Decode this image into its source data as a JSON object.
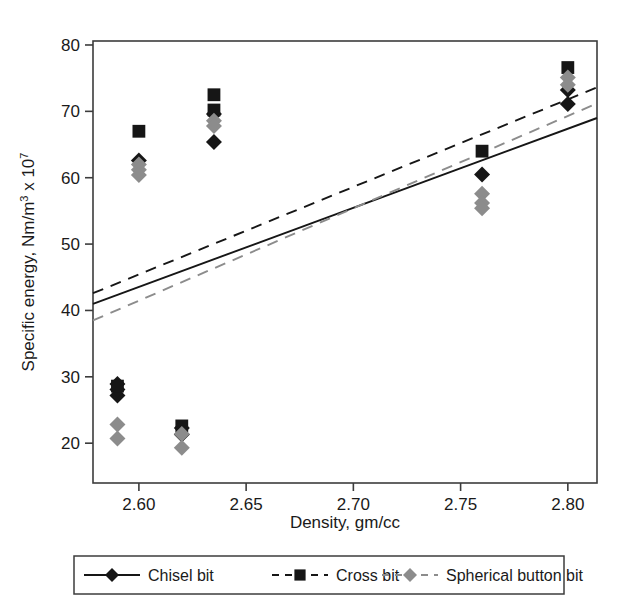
{
  "chart_data": {
    "type": "scatter",
    "title": "",
    "xlabel": "Density, gm/cc",
    "ylabel": "Specific energy, Nm/m3 x 107",
    "ylabel_parts": {
      "main": "Specific energy, Nm/m",
      "sup1": "3",
      "mid": " x 10",
      "sup2": "7"
    },
    "xlim": [
      2.5786,
      2.8136
    ],
    "ylim": [
      14.0,
      80.6
    ],
    "xticks": [
      2.6,
      2.65,
      2.7,
      2.75,
      2.8
    ],
    "xticklabels": [
      "2.60",
      "2.65",
      "2.70",
      "2.75",
      "2.80"
    ],
    "yticks": [
      20,
      30,
      40,
      50,
      60,
      70,
      80
    ],
    "yticklabels": [
      "20",
      "30",
      "40",
      "50",
      "60",
      "70",
      "80"
    ],
    "grid": false,
    "legend_position": "below",
    "series": [
      {
        "name": "Chisel bit",
        "marker": "diamond",
        "color": "#161616",
        "linestyle": "solid",
        "points": [
          {
            "x": 2.59,
            "y": 27.2
          },
          {
            "x": 2.59,
            "y": 28.1
          },
          {
            "x": 2.59,
            "y": 28.9
          },
          {
            "x": 2.6,
            "y": 62.6
          },
          {
            "x": 2.62,
            "y": 22.3
          },
          {
            "x": 2.62,
            "y": 21.3
          },
          {
            "x": 2.635,
            "y": 65.4
          },
          {
            "x": 2.635,
            "y": 69.6
          },
          {
            "x": 2.76,
            "y": 60.5
          },
          {
            "x": 2.8,
            "y": 73.2
          },
          {
            "x": 2.8,
            "y": 71.1
          }
        ],
        "fit_line": {
          "x0": 2.5786,
          "y0": 41.0,
          "x1": 2.8136,
          "y1": 69.0
        }
      },
      {
        "name": "Cross bit",
        "marker": "square",
        "color": "#161616",
        "linestyle": "dashed",
        "points": [
          {
            "x": 2.59,
            "y": 28.6
          },
          {
            "x": 2.6,
            "y": 67.0
          },
          {
            "x": 2.62,
            "y": 22.6
          },
          {
            "x": 2.635,
            "y": 72.5
          },
          {
            "x": 2.635,
            "y": 70.2
          },
          {
            "x": 2.76,
            "y": 64.0
          },
          {
            "x": 2.8,
            "y": 76.6
          }
        ],
        "fit_line": {
          "x0": 2.5786,
          "y0": 42.6,
          "x1": 2.8136,
          "y1": 73.6
        }
      },
      {
        "name": "Spherical button bit",
        "marker": "diamond",
        "color": "#8c8c8c",
        "linestyle": "dashed",
        "points": [
          {
            "x": 2.59,
            "y": 22.8
          },
          {
            "x": 2.59,
            "y": 20.7
          },
          {
            "x": 2.6,
            "y": 62.0
          },
          {
            "x": 2.6,
            "y": 61.2
          },
          {
            "x": 2.6,
            "y": 60.4
          },
          {
            "x": 2.62,
            "y": 21.4
          },
          {
            "x": 2.62,
            "y": 19.3
          },
          {
            "x": 2.635,
            "y": 68.6
          },
          {
            "x": 2.635,
            "y": 67.8
          },
          {
            "x": 2.76,
            "y": 57.6
          },
          {
            "x": 2.76,
            "y": 56.2
          },
          {
            "x": 2.76,
            "y": 55.4
          },
          {
            "x": 2.8,
            "y": 75.1
          },
          {
            "x": 2.8,
            "y": 74.0
          }
        ],
        "fit_line": {
          "x0": 2.5786,
          "y0": 38.5,
          "x1": 2.8136,
          "y1": 71.2
        }
      }
    ]
  },
  "legend": {
    "entries": [
      {
        "label": "Chisel bit"
      },
      {
        "label": "Cross bit"
      },
      {
        "label": "Spherical button bit"
      }
    ]
  },
  "colors": {
    "dark": "#161616",
    "gray": "#8c8c8c",
    "frame": "#3c3c3c",
    "background": "#ffffff"
  }
}
